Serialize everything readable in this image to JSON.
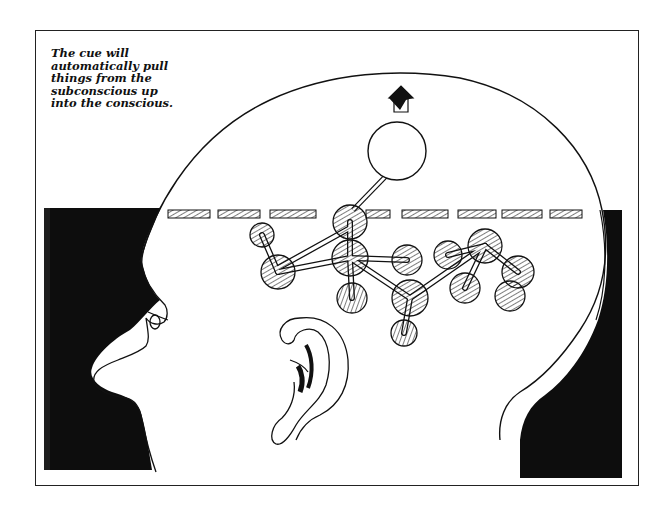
{
  "caption": {
    "lines": [
      "The cue will",
      "automatically pull",
      "things from the",
      "subconscious up",
      "into the conscious."
    ]
  },
  "illustration": {
    "subject": "head-profile-with-molecule-structure",
    "elements": [
      "head-outline",
      "face-profile",
      "dark-hair-left",
      "dark-hair-right",
      "ear",
      "dashed-threshold-line",
      "molecule-balls",
      "raised-empty-circle",
      "up-arrow"
    ]
  },
  "colors": {
    "ink": "#111111",
    "paper": "#ffffff"
  }
}
